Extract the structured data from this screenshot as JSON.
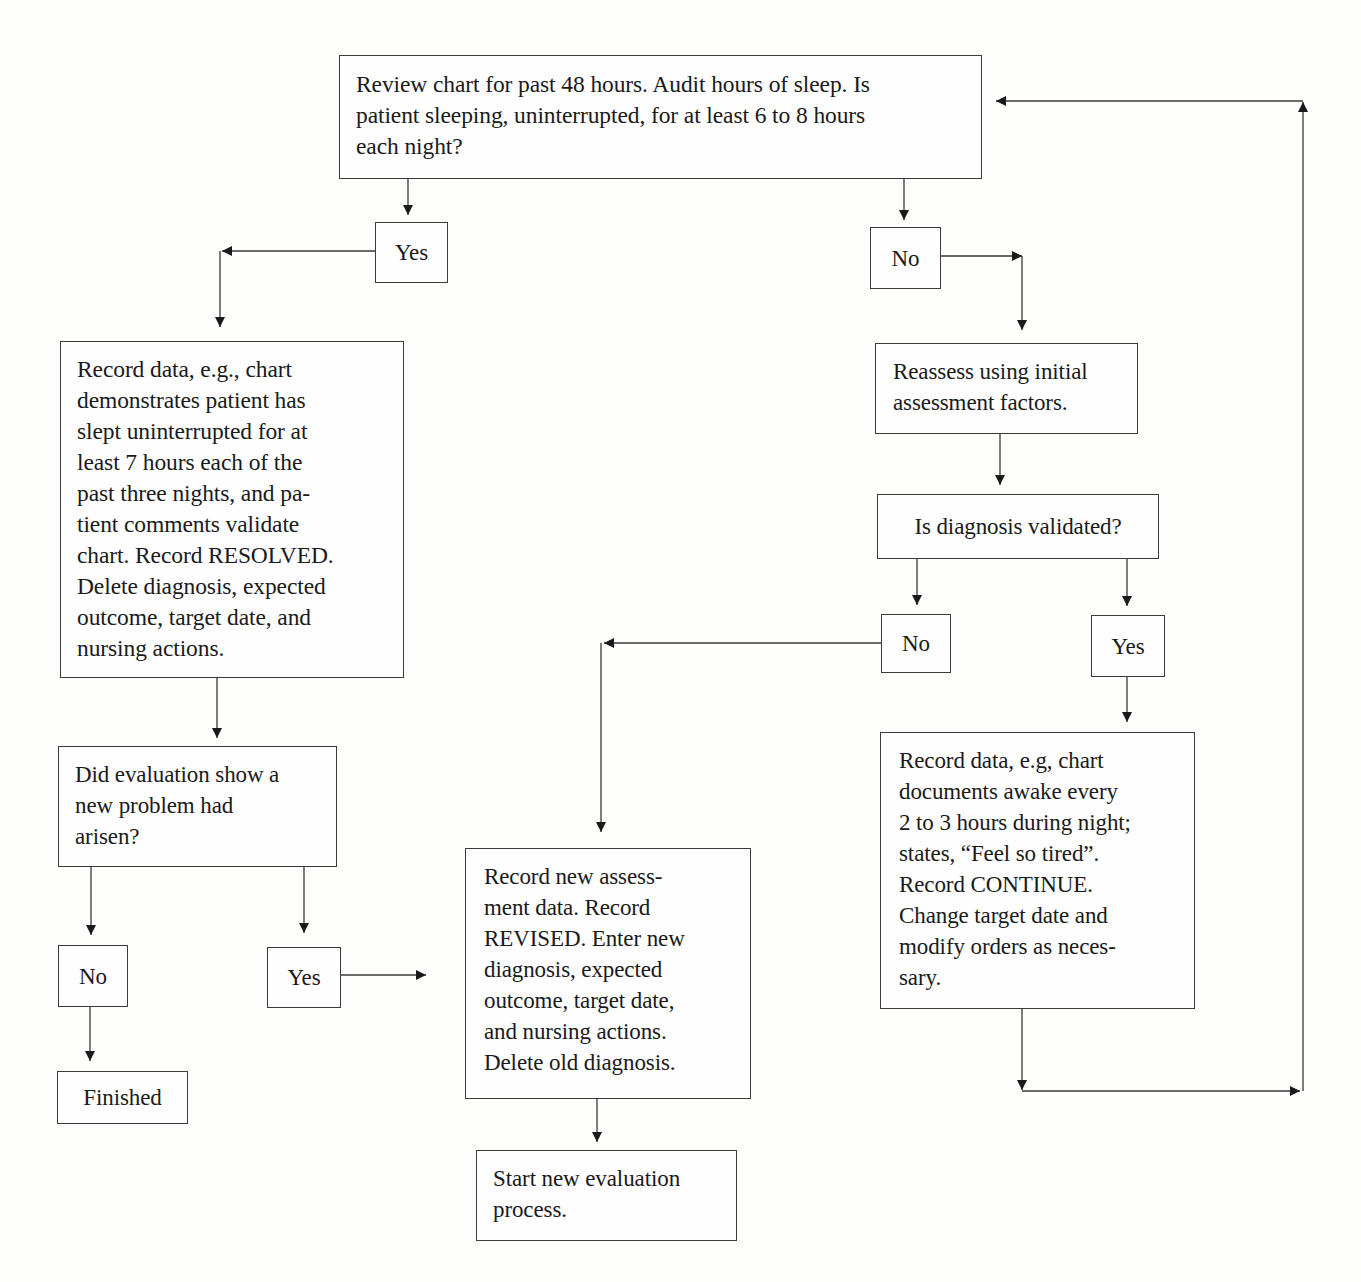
{
  "flowchart": {
    "nodes": {
      "start": {
        "text": "Review chart for past 48 hours. Audit hours of sleep. Is\npatient sleeping, uninterrupted, for at least 6 to 8 hours\neach night?"
      },
      "yes_top": {
        "text": "Yes"
      },
      "no_top": {
        "text": "No"
      },
      "record_resolved": {
        "text": "Record data, e.g., chart\ndemonstrates patient has\nslept uninterrupted for at\nleast 7 hours each of the\npast three nights, and pa-\ntient comments validate\nchart. Record RESOLVED.\nDelete diagnosis, expected\noutcome, target date, and\nnursing actions."
      },
      "reassess": {
        "text": "Reassess using initial\nassessment factors."
      },
      "diagnosis_validated": {
        "text": "Is diagnosis validated?"
      },
      "no_validated": {
        "text": "No"
      },
      "yes_validated": {
        "text": "Yes"
      },
      "new_problem": {
        "text": "Did evaluation show a\nnew problem had\narisen?"
      },
      "no_new_problem": {
        "text": "No"
      },
      "yes_new_problem": {
        "text": "Yes"
      },
      "finished": {
        "text": "Finished"
      },
      "record_revised": {
        "text": "Record new assess-\nment data. Record\nREVISED. Enter new\ndiagnosis, expected\noutcome, target date,\nand nursing actions.\nDelete old diagnosis."
      },
      "record_continue": {
        "text": "Record data, e.g, chart\ndocuments awake every\n2 to 3 hours during night;\nstates, “Feel so tired”.\nRecord CONTINUE.\nChange target date and\nmodify orders as neces-\nsary."
      },
      "start_new": {
        "text": "Start new evaluation\nprocess."
      }
    },
    "edges": [
      {
        "from": "start",
        "to": "yes_top"
      },
      {
        "from": "start",
        "to": "no_top"
      },
      {
        "from": "yes_top",
        "to": "record_resolved"
      },
      {
        "from": "no_top",
        "to": "reassess"
      },
      {
        "from": "reassess",
        "to": "diagnosis_validated"
      },
      {
        "from": "diagnosis_validated",
        "to": "no_validated"
      },
      {
        "from": "diagnosis_validated",
        "to": "yes_validated"
      },
      {
        "from": "no_validated",
        "to": "record_revised"
      },
      {
        "from": "yes_validated",
        "to": "record_continue"
      },
      {
        "from": "record_resolved",
        "to": "new_problem"
      },
      {
        "from": "new_problem",
        "to": "no_new_problem"
      },
      {
        "from": "new_problem",
        "to": "yes_new_problem"
      },
      {
        "from": "no_new_problem",
        "to": "finished"
      },
      {
        "from": "yes_new_problem",
        "to": "record_revised"
      },
      {
        "from": "record_revised",
        "to": "start_new"
      },
      {
        "from": "record_continue",
        "to": "start"
      }
    ],
    "colors": {
      "line": "#3a3a3a",
      "background": "#fdfdfc",
      "text": "#1a1a1a"
    }
  }
}
